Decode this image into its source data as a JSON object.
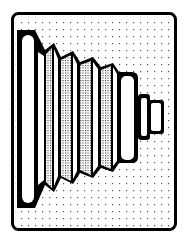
{
  "illustration": {
    "subject": "bellows boot",
    "style": "black line art on dotted grid",
    "colors": {
      "ink": "#000000",
      "paper": "#ffffff",
      "dot": "#555555"
    },
    "frame": {
      "x": 11,
      "y": 12,
      "width": 166,
      "height": 219,
      "stroke": 3,
      "corner_radius": 6
    },
    "pleat_count": 5
  }
}
